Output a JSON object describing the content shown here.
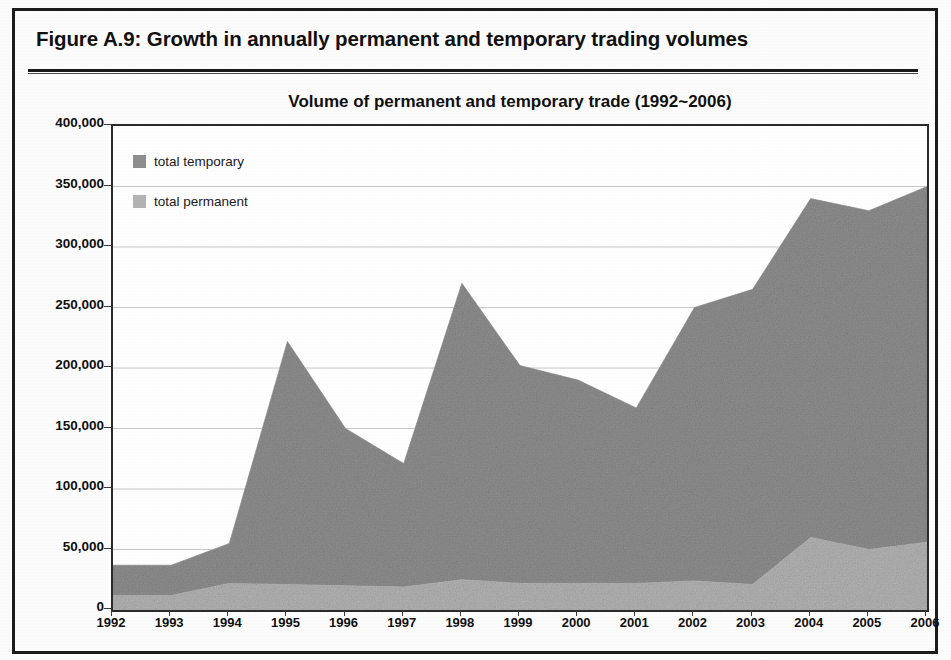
{
  "figure": {
    "caption": "Figure A.9:  Growth in annually permanent and temporary trading volumes"
  },
  "chart_data": {
    "type": "area",
    "stacked": true,
    "title": "Volume of permanent and temporary trade (1992~2006)",
    "xlabel": "",
    "ylabel": "",
    "grid": true,
    "legend_position": "inside-top-left",
    "ylim": [
      0,
      400000
    ],
    "ytick_step": 50000,
    "ytick_labels": [
      "400,000",
      "350,000",
      "300,000",
      "250,000",
      "200,000",
      "150,000",
      "100,000",
      "50,000",
      "0"
    ],
    "ytick_values": [
      400000,
      350000,
      300000,
      250000,
      200000,
      150000,
      100000,
      50000,
      0
    ],
    "categories": [
      "1992",
      "1993",
      "1994",
      "1995",
      "1996",
      "1997",
      "1998",
      "1999",
      "2000",
      "2001",
      "2002",
      "2003",
      "2004",
      "2005",
      "2006"
    ],
    "x": [
      1992,
      1993,
      1994,
      1995,
      1996,
      1997,
      1998,
      1999,
      2000,
      2001,
      2002,
      2003,
      2004,
      2005,
      2006
    ],
    "series": [
      {
        "name": "total permanent",
        "color": "#b4b4b4",
        "values": [
          12000,
          12000,
          22000,
          21000,
          20000,
          19000,
          25000,
          22000,
          22000,
          22000,
          24000,
          21000,
          60000,
          50000,
          56000
        ]
      },
      {
        "name": "total temporary",
        "color": "#8f8f8f",
        "values": [
          25000,
          25000,
          33000,
          201000,
          130000,
          102000,
          245000,
          180000,
          168000,
          145000,
          226000,
          244000,
          280000,
          280000,
          294000
        ]
      }
    ],
    "totals": [
      37000,
      37000,
      55000,
      222000,
      150000,
      121000,
      270000,
      202000,
      190000,
      167000,
      250000,
      265000,
      340000,
      330000,
      350000
    ],
    "colors": {
      "temporary": "#8f8f8f",
      "permanent": "#b4b4b4",
      "axis": "#2b2b2b",
      "grid": "#c8c8c8",
      "text": "#101010"
    }
  }
}
